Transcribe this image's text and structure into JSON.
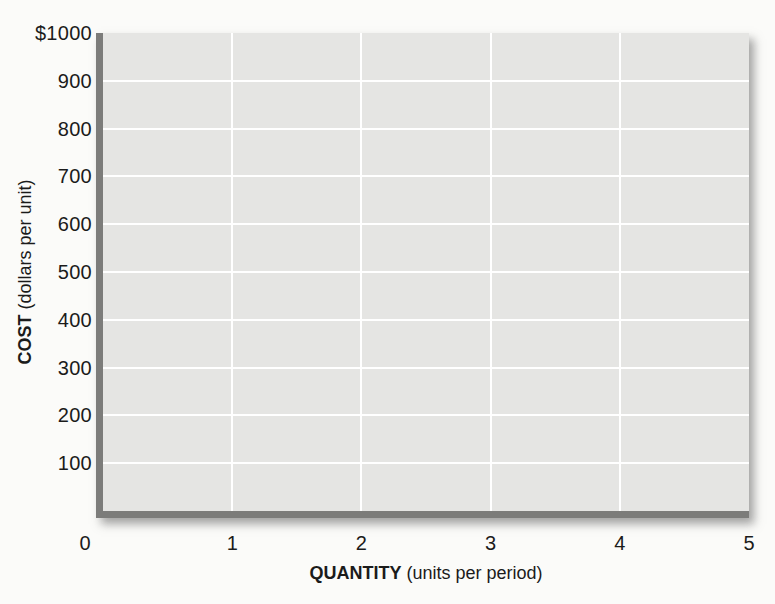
{
  "figure": {
    "background": "#fbfbf9",
    "text_color": "#1b1b1b"
  },
  "chart_data": {
    "type": "line",
    "title": "",
    "series": [],
    "note": "empty coordinate grid with no plotted data",
    "xlabel_bold": "QUANTITY",
    "xlabel_rest": " (units per period)",
    "ylabel_bold": "COST",
    "ylabel_rest": " (dollars per unit)",
    "x_ticks": [
      {
        "label": "0",
        "value": 0
      },
      {
        "label": "1",
        "value": 1
      },
      {
        "label": "2",
        "value": 2
      },
      {
        "label": "3",
        "value": 3
      },
      {
        "label": "4",
        "value": 4
      },
      {
        "label": "5",
        "value": 5
      }
    ],
    "y_ticks": [
      {
        "label": "$1000",
        "value": 1000
      },
      {
        "label": "900",
        "value": 900
      },
      {
        "label": "800",
        "value": 800
      },
      {
        "label": "700",
        "value": 700
      },
      {
        "label": "600",
        "value": 600
      },
      {
        "label": "500",
        "value": 500
      },
      {
        "label": "400",
        "value": 400
      },
      {
        "label": "300",
        "value": 300
      },
      {
        "label": "200",
        "value": 200
      },
      {
        "label": "100",
        "value": 100
      }
    ],
    "xlim": [
      0,
      5
    ],
    "ylim": [
      0,
      1000
    ],
    "grid": true,
    "legend_position": "none",
    "colors": {
      "plot_background": "#e5e5e3",
      "gridline": "#ffffff",
      "axis_bar": "#7c7c7a"
    }
  }
}
